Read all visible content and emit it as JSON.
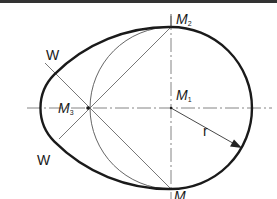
{
  "figure": {
    "labels": {
      "m2": {
        "main": "M",
        "sub": "2"
      },
      "m1": {
        "main": "M",
        "sub": "1"
      },
      "m3": {
        "main": "M",
        "sub": "3"
      },
      "m_bottom": {
        "main": "M",
        "sub": ""
      },
      "w_top": "W",
      "w_bottom": "W",
      "radius": "r"
    },
    "colors": {
      "outline": "#1a1a1a",
      "construction": "#555555",
      "background": "#ffffff"
    }
  }
}
